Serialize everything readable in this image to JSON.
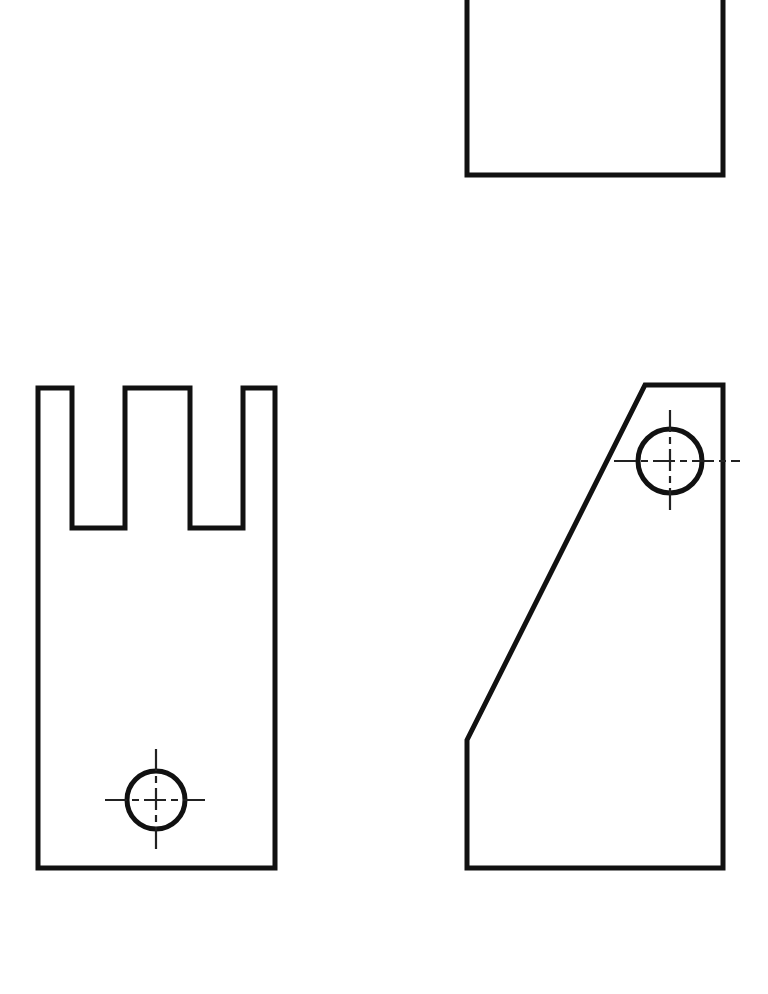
{
  "sheet": {
    "title": "Orthographic Projection Drawing",
    "background_color": "#ffffff",
    "line_color": "#111111",
    "centerline_color": "#222222",
    "width": 768,
    "height": 994,
    "outline_stroke_width": 5,
    "centerline_stroke_width": 2.2
  },
  "views": {
    "top_view": {
      "name": "Top View",
      "shape": "rectangle",
      "clipped_at_top_edge": true,
      "path": "M 467,-40 L 467,175 L 723,175 L 723,-40",
      "bounds": {
        "left": 467,
        "right": 723,
        "top": -40,
        "bottom": 175
      },
      "width_px": 256,
      "visible_height_px": 215
    },
    "front_view": {
      "name": "Front View",
      "shape": "slotted-bracket",
      "path": "M 38,388 L 72,388 L 72,528 L 125,528 L 125,388 L 190,388 L 190,528 L 243,528 L 243,388 L 275,388 L 275,868 L 38,868 Z",
      "bounds": {
        "left": 38,
        "right": 275,
        "top": 388,
        "bottom": 868
      },
      "width_px": 237,
      "height_px": 480,
      "prongs": [
        {
          "label": "prong-left",
          "left": 38,
          "right": 72
        },
        {
          "label": "prong-middle",
          "left": 125,
          "right": 190
        },
        {
          "label": "prong-right",
          "left": 243,
          "right": 275
        }
      ],
      "slots": [
        {
          "label": "slot-left",
          "left": 72,
          "right": 125,
          "bottom": 528,
          "depth_px": 140
        },
        {
          "label": "slot-right",
          "left": 190,
          "right": 243,
          "bottom": 528,
          "depth_px": 140
        }
      ],
      "hole": {
        "label": "through-hole",
        "cx": 156,
        "cy": 800,
        "r": 29,
        "centerline_h": {
          "x1": 105,
          "x2": 208,
          "y": 800
        },
        "centerline_v": {
          "y1": 749,
          "y2": 851,
          "x": 156
        }
      }
    },
    "side_view": {
      "name": "Side View",
      "shape": "chamfered-block",
      "path": "M 467,740 L 645,385 L 723,385 L 723,868 L 467,868 Z",
      "bounds": {
        "left": 467,
        "right": 723,
        "top": 385,
        "bottom": 868
      },
      "width_px": 256,
      "height_px": 483,
      "angled_edge": {
        "x1": 467,
        "y1": 740,
        "x2": 645,
        "y2": 385
      },
      "hole": {
        "label": "through-hole",
        "cx": 670,
        "cy": 461,
        "r": 32,
        "centerline_h": {
          "x1": 614,
          "x2": 740,
          "y": 461
        },
        "centerline_v": {
          "y1": 410,
          "y2": 512,
          "x": 670
        }
      }
    }
  },
  "centerline_dash_pattern": "22 5 7 5",
  "legend": {
    "view_count": 3,
    "hole_count": 2
  }
}
